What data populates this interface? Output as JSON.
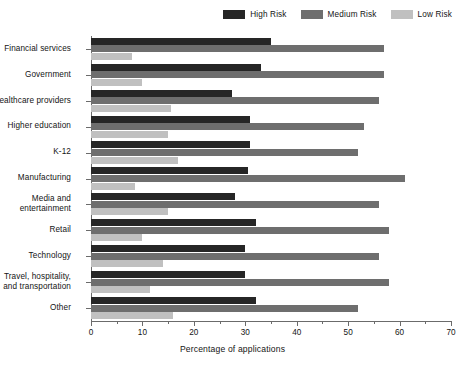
{
  "chart_data": {
    "type": "bar",
    "orientation": "horizontal",
    "title": "",
    "xlabel": "Percentage of applications",
    "ylabel": "",
    "xlim": [
      0,
      70
    ],
    "xticks": [
      0,
      10,
      20,
      30,
      40,
      50,
      60,
      70
    ],
    "xminorticks": [
      5,
      15,
      25,
      35,
      45,
      55,
      65
    ],
    "grid": false,
    "legend_position": "top-right",
    "categories": [
      "Financial services",
      "Government",
      "Healthcare providers",
      "Higher education",
      "K-12",
      "Manufacturing",
      "Media and\nentertainment",
      "Retail",
      "Technology",
      "Travel, hospitality,\nand transportation",
      "Other"
    ],
    "series": [
      {
        "name": "High Risk",
        "color": "#262626",
        "values": [
          35,
          33,
          27.5,
          31,
          31,
          30.5,
          28,
          32,
          30,
          30,
          32
        ]
      },
      {
        "name": "Medium Risk",
        "color": "#6e6e6e",
        "values": [
          57,
          57,
          56,
          53,
          52,
          61,
          56,
          58,
          56,
          58,
          52
        ]
      },
      {
        "name": "Low Risk",
        "color": "#c0c0c0",
        "values": [
          8,
          10,
          15.5,
          15,
          17,
          8.5,
          15,
          10,
          14,
          11.5,
          16
        ]
      }
    ]
  }
}
